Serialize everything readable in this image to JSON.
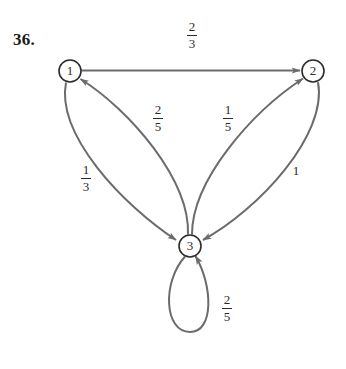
{
  "problem": {
    "number": "36."
  },
  "diagram": {
    "type": "state-transition-diagram",
    "stroke_color": "#6b6b6b",
    "text_color": "#2b2b2b",
    "background": "#ffffff",
    "nodes": [
      {
        "id": "1",
        "label": "1",
        "cx": 70,
        "cy": 71,
        "r": 11
      },
      {
        "id": "2",
        "label": "2",
        "cx": 313,
        "cy": 71,
        "r": 11
      },
      {
        "id": "3",
        "label": "3",
        "cx": 190,
        "cy": 246,
        "r": 11
      }
    ],
    "edges": [
      {
        "id": "e12",
        "from": "1",
        "to": "2",
        "shape": "straight",
        "label_numerator": "2",
        "label_denominator": "3",
        "label_text": "2/3"
      },
      {
        "id": "e13",
        "from": "1",
        "to": "3",
        "shape": "curve-left",
        "label_numerator": "1",
        "label_denominator": "3",
        "label_text": "1/3"
      },
      {
        "id": "e31",
        "from": "3",
        "to": "1",
        "shape": "curve-right",
        "label_numerator": "2",
        "label_denominator": "5",
        "label_text": "2/5"
      },
      {
        "id": "e32",
        "from": "3",
        "to": "2",
        "shape": "curve-left",
        "label_numerator": "1",
        "label_denominator": "5",
        "label_text": "1/5"
      },
      {
        "id": "e23",
        "from": "2",
        "to": "3",
        "shape": "curve-right",
        "label_numerator": "1",
        "label_denominator": "",
        "label_text": "1"
      },
      {
        "id": "e33",
        "from": "3",
        "to": "3",
        "shape": "self-loop",
        "label_numerator": "2",
        "label_denominator": "5",
        "label_text": "2/5"
      }
    ]
  },
  "labels": {
    "node1": "1",
    "node2": "2",
    "node3": "3",
    "edge_1_2_num": "2",
    "edge_1_2_den": "3",
    "edge_3_1_num": "2",
    "edge_3_1_den": "5",
    "edge_3_2_num": "1",
    "edge_3_2_den": "5",
    "edge_1_3_num": "1",
    "edge_1_3_den": "3",
    "edge_2_3": "1",
    "edge_3_3_num": "2",
    "edge_3_3_den": "5"
  }
}
